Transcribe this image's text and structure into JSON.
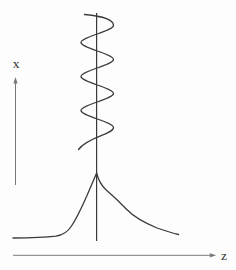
{
  "figure": {
    "background_color": "#fdfdfd",
    "curve_color": "#3a3a3a",
    "axis_color": "#787878",
    "label_color": "#2f2f2f",
    "x_axis": {
      "label": "x"
    },
    "z_axis": {
      "label": "z"
    }
  }
}
